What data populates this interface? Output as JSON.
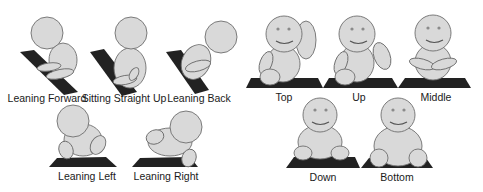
{
  "left_panel": {
    "figures": [
      {
        "id": "leaning-forward",
        "label": "Leaning Forward"
      },
      {
        "id": "sitting-straight-up",
        "label": "Sitting Straight Up"
      },
      {
        "id": "leaning-back",
        "label": "Leaning Back"
      },
      {
        "id": "leaning-left",
        "label": "Leaning Left"
      },
      {
        "id": "leaning-right",
        "label": "Leaning Right"
      }
    ]
  },
  "right_panel": {
    "figures": [
      {
        "id": "top",
        "label": "Top"
      },
      {
        "id": "up",
        "label": "Up"
      },
      {
        "id": "middle",
        "label": "Middle"
      },
      {
        "id": "down",
        "label": "Down"
      },
      {
        "id": "bottom",
        "label": "Bottom"
      }
    ]
  },
  "colors": {
    "figure_fill": "#d9d9d9",
    "figure_stroke": "#6e6e6e",
    "mat": "#222222",
    "background": "#ffffff"
  }
}
